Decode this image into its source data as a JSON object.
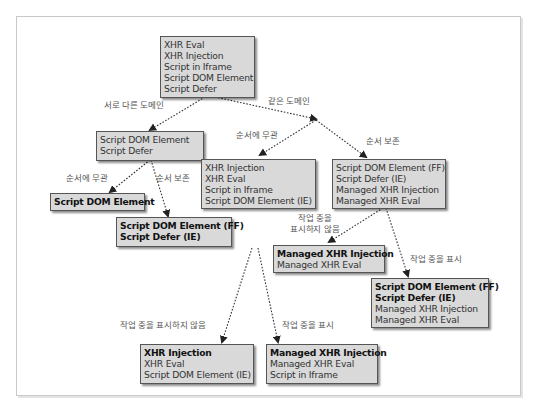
{
  "diagram": {
    "root": {
      "lines": [
        "XHR Eval",
        "XHR Injection",
        "Script in Iframe",
        "Script DOM Element",
        "Script Defer"
      ]
    },
    "edge_labels": {
      "different_domain": "서로 다른 도메인",
      "same_domain": "같은 도메인",
      "order_irrelevant_left": "순서에 무관",
      "order_preserved_left": "순서 보존",
      "order_irrelevant_right": "순서에 무관",
      "order_preserved_right": "순서 보존",
      "no_busy_indicator_right_line1": "작업 중을",
      "no_busy_indicator_right_line2": "표시하지 않음",
      "busy_indicator_right": "작업 중을 표시",
      "no_busy_indicator_bottom": "작업 중을 표시하지 않음",
      "busy_indicator_bottom": "작업 중을 표시"
    },
    "boxes": {
      "diff_domain": {
        "lines": [
          {
            "text": "Script DOM Element",
            "bold": false
          },
          {
            "text": "Script Defer",
            "bold": false
          }
        ]
      },
      "diff_order_irrelevant": {
        "lines": [
          {
            "text": "Script DOM Element",
            "bold": true
          }
        ]
      },
      "diff_order_preserved": {
        "lines": [
          {
            "text": "Script DOM Element (FF)",
            "bold": true
          },
          {
            "text": "Script Defer (IE)",
            "bold": true
          }
        ]
      },
      "same_order_irrelevant": {
        "lines": [
          {
            "text": "XHR Injection",
            "bold": false
          },
          {
            "text": "XHR Eval",
            "bold": false
          },
          {
            "text": "Script in Iframe",
            "bold": false
          },
          {
            "text": "Script DOM Element (IE)",
            "bold": false
          }
        ]
      },
      "same_order_preserved": {
        "lines": [
          {
            "text": "Script DOM Element (FF)",
            "bold": false
          },
          {
            "text": "Script Defer (IE)",
            "bold": false
          },
          {
            "text": "Managed XHR Injection",
            "bold": false
          },
          {
            "text": "Managed XHR Eval",
            "bold": false
          }
        ]
      },
      "preserved_no_busy": {
        "lines": [
          {
            "text": "Managed XHR Injection",
            "bold": true
          },
          {
            "text": "Managed XHR Eval",
            "bold": false
          }
        ]
      },
      "preserved_busy": {
        "lines": [
          {
            "text": "Script DOM Element (FF)",
            "bold": true
          },
          {
            "text": "Script Defer (IE)",
            "bold": true
          },
          {
            "text": "Managed XHR Injection",
            "bold": false
          },
          {
            "text": "Managed XHR Eval",
            "bold": false
          }
        ]
      },
      "irrelevant_no_busy": {
        "lines": [
          {
            "text": "XHR Injection",
            "bold": true
          },
          {
            "text": "XHR Eval",
            "bold": false
          },
          {
            "text": "Script DOM Element (IE)",
            "bold": false
          }
        ]
      },
      "irrelevant_busy": {
        "lines": [
          {
            "text": "Managed XHR Injection",
            "bold": true
          },
          {
            "text": "Managed XHR Eval",
            "bold": false
          },
          {
            "text": "Script in Iframe",
            "bold": false
          }
        ]
      }
    },
    "colors": {
      "box_fill": "#d9d9d9",
      "box_border": "#555555",
      "edge": "#333333",
      "label": "#555555"
    }
  }
}
